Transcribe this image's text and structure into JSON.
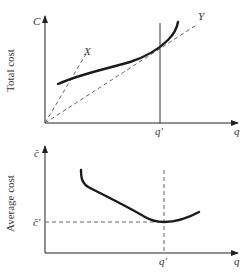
{
  "top_panel": {
    "y_axis_label": "Total cost",
    "y_axis_symbol": "C",
    "x_axis_symbol": "q",
    "q_prime_label": "q′",
    "ray_labels": {
      "x": "X",
      "y": "Y"
    },
    "description": "Total cost curve C(q) with rays from origin: steep ray X and tangent ray Y touching curve at q′"
  },
  "bottom_panel": {
    "y_axis_label": "Average cost",
    "y_axis_symbol": "c̄",
    "x_axis_symbol": "q",
    "q_prime_label": "q′",
    "c_prime_label": "c̄′",
    "description": "U-shaped average cost curve with minimum c̄′ at output q′"
  }
}
